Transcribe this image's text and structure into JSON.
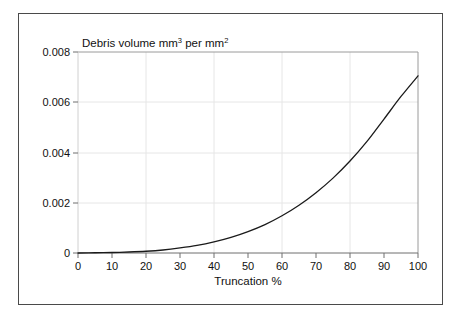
{
  "chart_data": {
    "type": "line",
    "title": "Debris volume mm3 per mm2",
    "title_parts": {
      "lead": "Debris volume mm",
      "sup1": "3",
      "mid": " per mm",
      "sup2": "2"
    },
    "xlabel": "Truncation %",
    "ylabel": "",
    "xlim": [
      0,
      100
    ],
    "ylim": [
      0,
      0.008
    ],
    "xticks": [
      0,
      10,
      20,
      30,
      40,
      50,
      60,
      70,
      80,
      90,
      100
    ],
    "xtick_labels": [
      "0",
      "10",
      "20",
      "30",
      "40",
      "50",
      "60",
      "70",
      "80",
      "90",
      "100"
    ],
    "yticks": [
      0,
      0.002,
      0.004,
      0.006,
      0.008
    ],
    "ytick_labels": [
      "0",
      "0.002",
      "0.004",
      "0.006",
      "0.008"
    ],
    "grid": true,
    "grid_x_values": [
      20,
      40,
      60,
      80,
      100
    ],
    "grid_y_values": [
      0.002,
      0.004,
      0.006,
      0.008
    ],
    "legend": null,
    "legend_position": "none",
    "line_color": "#1a1a1a",
    "grid_color": "#e3e3e3",
    "axis_color": "#8a8a8a",
    "frame_color": "#4a4a4a",
    "x": [
      0,
      5,
      10,
      15,
      20,
      25,
      30,
      35,
      40,
      45,
      50,
      55,
      60,
      65,
      70,
      75,
      80,
      85,
      90,
      95,
      100
    ],
    "values": [
      0.0,
      1e-05,
      2e-05,
      4e-05,
      7e-05,
      0.00012,
      0.0002,
      0.0003,
      0.00044,
      0.00062,
      0.00085,
      0.00113,
      0.00148,
      0.0019,
      0.0024,
      0.00298,
      0.00366,
      0.00444,
      0.00533,
      0.00623,
      0.00705
    ],
    "annotations": []
  }
}
